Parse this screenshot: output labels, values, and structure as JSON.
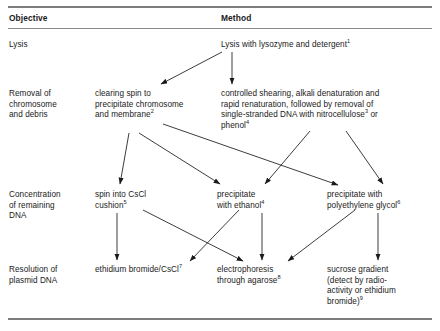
{
  "table": {
    "headers": {
      "objective": "Objective",
      "method": "Method"
    },
    "rows": [
      {
        "objective": "Lysis",
        "methods": [
          {
            "text": "Lysis with lysozyme and detergent",
            "note": "1"
          }
        ]
      },
      {
        "objective": "Removal of\nchromosome\nand debris",
        "methods": [
          {
            "text": "clearing spin to\nprecipitate chromosome\nand membrane",
            "note": "2"
          },
          {
            "text": "controlled shearing, alkali denaturation and\nrapid renaturation, followed by removal of\nsingle-stranded DNA with nitrocellulose",
            "note": "3",
            "text_after": " or\nphenol",
            "note_after": "4"
          }
        ]
      },
      {
        "objective": "Concentration\nof remaining\nDNA",
        "methods": [
          {
            "text": "spin into CsCl\ncushion",
            "note": "5"
          },
          {
            "text": "precipitate\nwith ethanol",
            "note": "4"
          },
          {
            "text": "precipitate with\npolyethylene glycol",
            "note": "6"
          }
        ]
      },
      {
        "objective": "Resolution of\nplasmid DNA",
        "methods": [
          {
            "text": "ethidium bromide/CsCl",
            "note": "7"
          },
          {
            "text": "electrophoresis\nthrough agarose",
            "note": "8"
          },
          {
            "text": "sucrose gradient\n(detect by radio-\nactivity or ethidium\nbromide)",
            "note": "9"
          }
        ]
      }
    ]
  },
  "flow": {
    "arrow_color": "#1a1a1a",
    "description": "flow arrows connecting method steps"
  }
}
